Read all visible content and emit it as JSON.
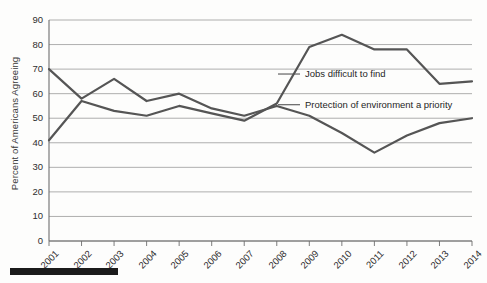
{
  "chart_data": {
    "type": "line",
    "title": "",
    "xlabel": "",
    "ylabel": "Percent of Americans Agreeing",
    "x": [
      "2001",
      "2002",
      "2003",
      "2004",
      "2005",
      "2006",
      "2007",
      "2008",
      "2009",
      "2010",
      "2011",
      "2012",
      "2013",
      "2014"
    ],
    "ylim": [
      0,
      90
    ],
    "yticks": [
      0,
      10,
      20,
      30,
      40,
      50,
      60,
      70,
      80,
      90
    ],
    "grid": true,
    "legend_position": "inline-annotations",
    "series": [
      {
        "name": "Jobs difficult to find",
        "values": [
          41,
          57,
          53,
          51,
          55,
          52,
          49,
          56,
          79,
          84,
          78,
          78,
          64,
          65
        ]
      },
      {
        "name": "Protection of environment a priority",
        "values": [
          70,
          58,
          66,
          57,
          60,
          54,
          51,
          55,
          51,
          44,
          36,
          43,
          48,
          50
        ]
      }
    ],
    "annotations": [
      {
        "text": "Jobs difficult to find",
        "x": "2009",
        "y": 68
      },
      {
        "text": "Protection of environment a priority",
        "x": "2009",
        "y": 55
      }
    ]
  },
  "axis": {
    "y_title": "Percent of Americans Agreeing",
    "y_tick_labels": [
      "90",
      "80",
      "70",
      "60",
      "50",
      "40",
      "30",
      "20",
      "10",
      "0"
    ],
    "x_tick_labels": [
      "2001",
      "2002",
      "2003",
      "2004",
      "2005",
      "2006",
      "2007",
      "2008",
      "2009",
      "2010",
      "2011",
      "2012",
      "2013",
      "2014"
    ]
  },
  "labels": {
    "jobs": "Jobs difficult to find",
    "environment": "Protection of environment a priority"
  },
  "colors": {
    "line": "#555555",
    "grid": "#9a9a9a",
    "axis": "#6e6e6e",
    "text": "#2e2e2e",
    "footer_bar": "#1b1b1b"
  }
}
